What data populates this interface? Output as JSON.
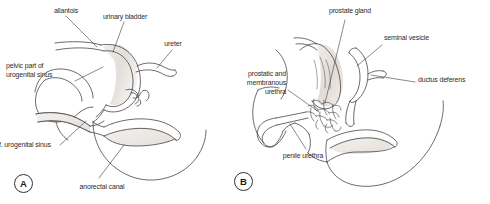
{
  "figure": {
    "background_color": "#ffffff",
    "line_color": "#3a3a3a",
    "label_color": "#2b2b2b",
    "shading_color": "#e8e4e0"
  },
  "panels": [
    {
      "id": "A",
      "marker_label": "A",
      "labels": [
        {
          "key": "allantois",
          "text": "allantois"
        },
        {
          "key": "urinary_bladder",
          "text": "urinary bladder"
        },
        {
          "key": "ureter",
          "text": "ureter"
        },
        {
          "key": "pelvic_part_l1",
          "text": "pelvic part of"
        },
        {
          "key": "pelvic_part_l2",
          "text": "urogenital sinus"
        },
        {
          "key": "def_ug_sinus",
          "text": "f. urogenital sinus"
        },
        {
          "key": "anorectal_canal",
          "text": "anorectal canal"
        }
      ]
    },
    {
      "id": "B",
      "marker_label": "B",
      "labels": [
        {
          "key": "prostate_gland",
          "text": "prostate gland"
        },
        {
          "key": "seminal_vesicle",
          "text": "seminal vesicle"
        },
        {
          "key": "ductus_deferens",
          "text": "ductus deferens"
        },
        {
          "key": "prost_memb_l1",
          "text": "prostatic and"
        },
        {
          "key": "prost_memb_l2",
          "text": "membranous"
        },
        {
          "key": "prost_memb_l3",
          "text": "urethra"
        },
        {
          "key": "penile_urethra",
          "text": "penile urethra"
        }
      ]
    }
  ],
  "panel_a": {
    "allantois": "allantois",
    "urinary_bladder": "urinary bladder",
    "ureter": "ureter",
    "pelvic_part_l1": "pelvic part of",
    "pelvic_part_l2": "urogenital sinus",
    "def_ug_sinus": "f. urogenital sinus",
    "anorectal_canal": "anorectal canal",
    "marker": "A"
  },
  "panel_b": {
    "prostate_gland": "prostate gland",
    "seminal_vesicle": "seminal vesicle",
    "ductus_deferens": "ductus deferens",
    "prost_memb_l1": "prostatic and",
    "prost_memb_l2": "membranous",
    "prost_memb_l3": "urethra",
    "penile_urethra": "penile urethra",
    "marker": "B"
  }
}
